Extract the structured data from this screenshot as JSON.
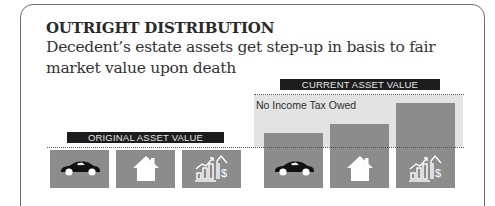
{
  "header": {
    "title": "OUTRIGHT DISTRIBUTION",
    "subtitle": "Decedent’s estate assets get step-up in basis to fair market value upon death"
  },
  "original": {
    "label": "ORIGINAL ASSET VALUE",
    "assets": [
      {
        "name": "car",
        "icon": "car-icon"
      },
      {
        "name": "house",
        "icon": "house-icon"
      },
      {
        "name": "investments",
        "icon": "growth-chart-dollar-icon"
      }
    ]
  },
  "current": {
    "label": "CURRENT ASSET VALUE",
    "note": "No Income Tax Owed",
    "assets": [
      {
        "name": "car",
        "icon": "car-icon"
      },
      {
        "name": "house",
        "icon": "house-icon"
      },
      {
        "name": "investments",
        "icon": "growth-chart-dollar-icon"
      }
    ]
  },
  "colors": {
    "box": "#8c8c8c",
    "label_bar": "#1c1c1c",
    "shade": "#e3e3e3",
    "border": "#6f6f6f"
  }
}
